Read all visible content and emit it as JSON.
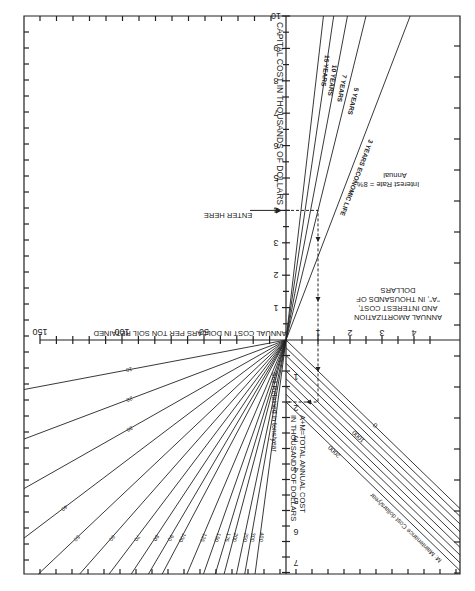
{
  "chart_data": {
    "type": "line",
    "orientation_note": "figure printed rotated 180 degrees",
    "quadrants": {
      "capital_cost": {
        "axis_label": "CAPITAL COST IN THOUSANDS OF DOLLARS",
        "ticks": [
          1,
          2,
          3,
          4,
          5,
          6,
          7,
          8,
          9,
          10
        ],
        "range": [
          0,
          10
        ],
        "enter_marker": {
          "label": "ENTER HERE",
          "value": 4
        }
      },
      "amortization": {
        "axis_label_lines": [
          "ANNUAL AMORTIZATION",
          "AND INTEREST COST,",
          "\"A\", IN THOUSANDS OF",
          "DOLLARS"
        ],
        "ticks": [
          1,
          2,
          3,
          4
        ],
        "range": [
          0,
          4.5
        ],
        "interest_rate_lines": [
          "Annual",
          "Interest Rate = 8%"
        ],
        "series": [
          {
            "name": "3 YEARS ECONOMIC LIFE",
            "years": 3,
            "A_per_1000_capital": 0.388
          },
          {
            "name": "5 YEARS",
            "years": 5,
            "A_per_1000_capital": 0.25
          },
          {
            "name": "7 YEARS",
            "years": 7,
            "A_per_1000_capital": 0.192
          },
          {
            "name": "10 YEARS",
            "years": 10,
            "A_per_1000_capital": 0.149
          },
          {
            "name": "15 YEARS",
            "years": 15,
            "A_per_1000_capital": 0.117
          }
        ]
      },
      "total_annual_cost": {
        "axis_label_lines": [
          "A+M=TOTAL ANNUAL COST",
          "IN THOUSANDS OF DOLLARS"
        ],
        "ticks": [
          1,
          2,
          3,
          4,
          5,
          6,
          7
        ],
        "range": [
          0,
          7.5
        ],
        "maintenance_label": "M: Maintenance Cost dollars/year",
        "series": [
          {
            "name": "0",
            "M": 0
          },
          {
            "name": "250",
            "M": 250
          },
          {
            "name": "500",
            "M": 500
          },
          {
            "name": "750",
            "M": 750
          },
          {
            "name": "1000",
            "M": 1000
          },
          {
            "name": "1250",
            "M": 1250
          },
          {
            "name": "1500",
            "M": 1500
          },
          {
            "name": "1750",
            "M": 1750
          },
          {
            "name": "2000",
            "M": 2000
          }
        ],
        "labeled_series": [
          "0",
          "1000",
          "2000"
        ]
      },
      "cost_per_ton": {
        "axis_label": "ANNUAL COST IN DOLLARS PER TON SOIL RETAINED",
        "ticks": [
          50,
          100,
          150
        ],
        "minor_tick_step": 10,
        "range": [
          0,
          150
        ],
        "soil_label": "Soil Retained in tons/year",
        "series": [
          10,
          20,
          30,
          40,
          50,
          60,
          70,
          80,
          90,
          100,
          125,
          150,
          175,
          200,
          250,
          300,
          400
        ]
      }
    },
    "example_path": {
      "capital_cost": 4,
      "years": 3,
      "A": 1.0,
      "M": 1000,
      "total": 2.0
    }
  }
}
